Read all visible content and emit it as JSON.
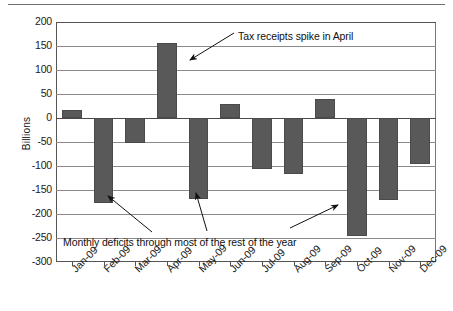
{
  "chart_data": {
    "type": "bar",
    "title": "",
    "xlabel": "",
    "ylabel": "Billions",
    "categories": [
      "Jan-09",
      "Feb-09",
      "Mar-09",
      "Apr-09",
      "May-09",
      "Jun-09",
      "Jul-09",
      "Aug-09",
      "Sep-09",
      "Oct-09",
      "Nov-09",
      "Dec-09"
    ],
    "values": [
      17,
      -176,
      -52,
      157,
      -168,
      30,
      -107,
      -116,
      40,
      -245,
      -170,
      -95
    ],
    "ylim": [
      -300,
      200
    ],
    "ytick_labels": [
      "200",
      "150",
      "100",
      "50",
      "0",
      "-50",
      "-100",
      "-150",
      "-200",
      "-250",
      "-300"
    ],
    "ytick_values": [
      200,
      150,
      100,
      50,
      0,
      -50,
      -100,
      -150,
      -200,
      -250,
      -300
    ],
    "grid": true,
    "legend": "none",
    "bar_color": "#595959",
    "gridline_color": "#8a8a8a",
    "axis_color": "#555555",
    "background_color": "#ffffff",
    "annotations": [
      {
        "id": "april-spike",
        "text": "Tax receipts spike in April",
        "points_to": "Apr-09"
      },
      {
        "id": "deficits",
        "text": "Monthly deficits through most of the rest of the year",
        "points_to": "Feb-09, May-09, Oct-09"
      }
    ]
  }
}
